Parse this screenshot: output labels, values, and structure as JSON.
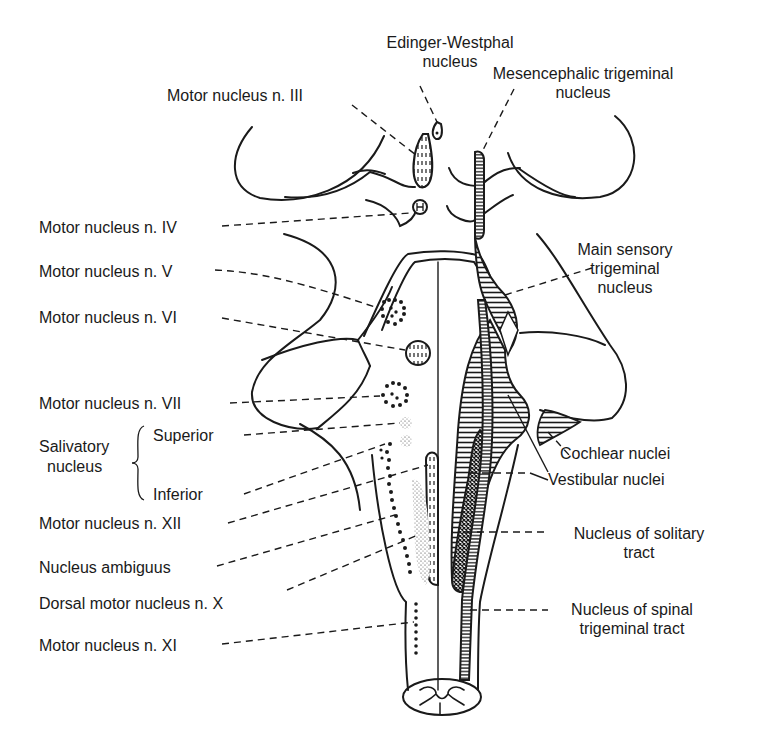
{
  "figure": {
    "line_color": "#1a1a1a",
    "background": "#ffffff"
  },
  "labels": {
    "edinger_westphal": [
      "Edinger-Westphal",
      "nucleus"
    ],
    "motor_iii": "Motor nucleus n. III",
    "mesencephalic_trigeminal": [
      "Mesencephalic trigeminal",
      "nucleus"
    ],
    "motor_iv": "Motor nucleus n. IV",
    "motor_v": "Motor nucleus n. V",
    "main_sensory_trigeminal": [
      "Main sensory",
      "trigeminal",
      "nucleus"
    ],
    "motor_vi": "Motor nucleus n. VI",
    "motor_vii": "Motor nucleus n. VII",
    "salivatory": {
      "group": [
        "Salivatory",
        "nucleus"
      ],
      "superior": "Superior",
      "inferior": "Inferior"
    },
    "cochlear": "Cochlear nuclei",
    "vestibular": "Vestibular nuclei",
    "motor_xii": "Motor nucleus n. XII",
    "solitary_tract": [
      "Nucleus of solitary",
      "tract"
    ],
    "ambiguus": "Nucleus ambiguus",
    "dorsal_motor_x": "Dorsal motor nucleus n. X",
    "spinal_trigeminal": [
      "Nucleus of spinal",
      "trigeminal tract"
    ],
    "motor_xi": "Motor nucleus n. XI"
  }
}
